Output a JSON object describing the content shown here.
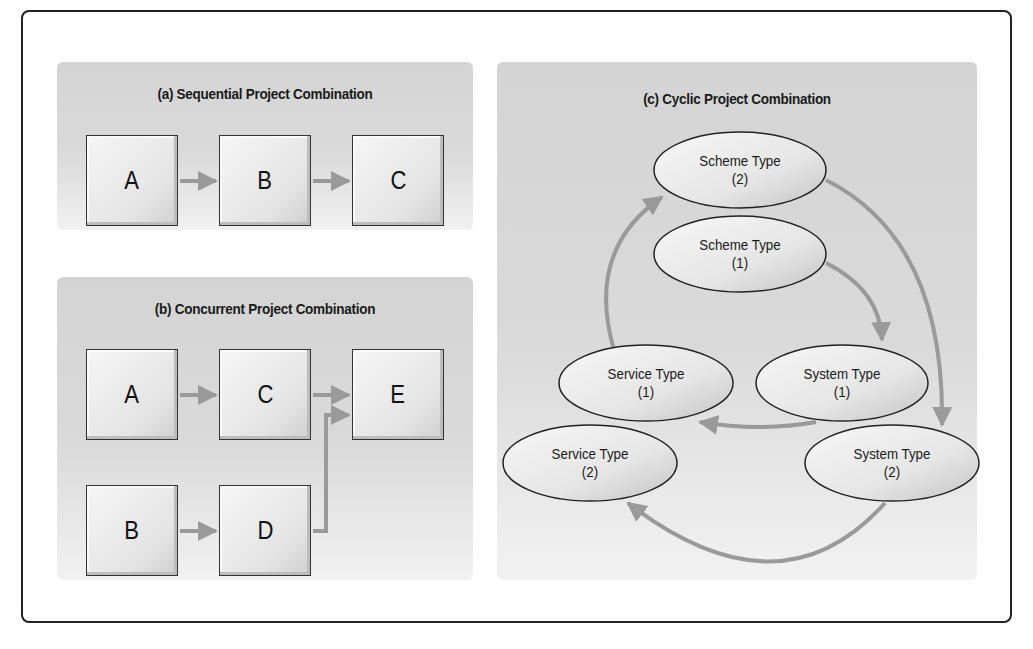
{
  "panels": {
    "a": {
      "title": "(a) Sequential Project Combination",
      "nodes": [
        "A",
        "B",
        "C"
      ],
      "edges": [
        [
          "A",
          "B"
        ],
        [
          "B",
          "C"
        ]
      ]
    },
    "b": {
      "title": "(b) Concurrent Project Combination",
      "nodes": [
        "A",
        "C",
        "E",
        "B",
        "D"
      ],
      "edges": [
        [
          "A",
          "C"
        ],
        [
          "C",
          "E"
        ],
        [
          "B",
          "D"
        ],
        [
          "D",
          "E"
        ]
      ]
    },
    "c": {
      "title": "(c) Cyclic Project Combination",
      "nodes": {
        "scheme2": {
          "name": "Scheme Type",
          "index": "(2)"
        },
        "scheme1": {
          "name": "Scheme Type",
          "index": "(1)"
        },
        "service1": {
          "name": "Service Type",
          "index": "(1)"
        },
        "system1": {
          "name": "System Type",
          "index": "(1)"
        },
        "service2": {
          "name": "Service Type",
          "index": "(2)"
        },
        "system2": {
          "name": "System Type",
          "index": "(2)"
        }
      },
      "edges": [
        [
          "Scheme Type (1)",
          "System Type (1)"
        ],
        [
          "System Type (1)",
          "Service Type (1)"
        ],
        [
          "Service Type (1)",
          "Scheme Type (2)"
        ],
        [
          "Scheme Type (2)",
          "System Type (2)"
        ],
        [
          "System Type (2)",
          "Service Type (2)"
        ]
      ]
    }
  },
  "colors": {
    "arrow": "#9a9a9a",
    "border": "#222222",
    "panel_bg": "#d6d6d6"
  }
}
